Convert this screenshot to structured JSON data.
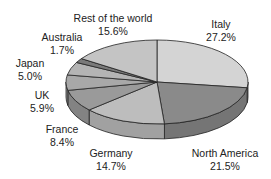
{
  "chart_data": {
    "type": "pie",
    "style": "3d",
    "title": "",
    "categories": [
      "Italy",
      "North America",
      "Germany",
      "France",
      "UK",
      "Japan",
      "Australia",
      "Rest of the world"
    ],
    "values": [
      27.2,
      21.5,
      14.7,
      8.4,
      5.9,
      5.0,
      1.7,
      15.6
    ],
    "unit": "%",
    "legend": "none (labels placed beside slices)",
    "colors": [
      "#d4d4d4",
      "#8a8a8a",
      "#bdbdbd",
      "#9a9a9a",
      "#a8a8a8",
      "#b4b4b4",
      "#7a7a7a",
      "#c4c4c4"
    ]
  },
  "labels": [
    {
      "name": "Italy",
      "value": "27.2%"
    },
    {
      "name": "North America",
      "value": "21.5%"
    },
    {
      "name": "Germany",
      "value": "14.7%"
    },
    {
      "name": "France",
      "value": "8.4%"
    },
    {
      "name": "UK",
      "value": "5.9%"
    },
    {
      "name": "Japan",
      "value": "5.0%"
    },
    {
      "name": "Australia",
      "value": "1.7%"
    },
    {
      "name": "Rest of the world",
      "value": "15.6%"
    }
  ]
}
